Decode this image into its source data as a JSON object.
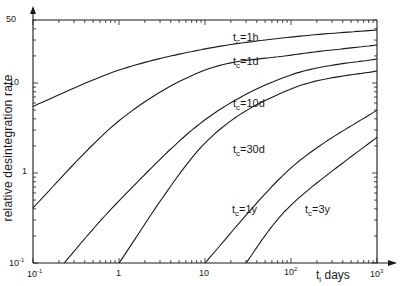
{
  "chart_data": {
    "type": "line",
    "title": "",
    "xlabel": "t_i days",
    "ylabel": "relative desintegration rate",
    "xscale": "log",
    "yscale": "log",
    "xlim": [
      0.1,
      1000
    ],
    "ylim": [
      0.1,
      50
    ],
    "grid": false,
    "legend": "inline curve labels",
    "x_tick_labels": [
      "10^-1",
      "1",
      "10",
      "10^2",
      "10^3"
    ],
    "y_tick_labels": [
      "10^-1",
      "1",
      "10",
      "50"
    ],
    "series": [
      {
        "name": "tc=1h",
        "label_main": "t",
        "label_sub": "c",
        "label_rest": "=1h",
        "x": [
          0.1,
          1,
          10,
          100,
          1000
        ],
        "y": [
          5.5,
          13.9,
          23.9,
          32.4,
          38.8
        ]
      },
      {
        "name": "tc=1d",
        "label_main": "t",
        "label_sub": "c",
        "label_rest": "=1d",
        "x": [
          0.1,
          1,
          10,
          100,
          1000
        ],
        "y": [
          0.41,
          3.8,
          13.9,
          20.4,
          26.4
        ]
      },
      {
        "name": "tc=10d",
        "label_main": "t",
        "label_sub": "c",
        "label_rest": "=10d",
        "x": [
          0.23,
          1,
          10,
          100,
          1000
        ],
        "y": [
          0.1,
          0.49,
          3.9,
          12.3,
          18.5
        ]
      },
      {
        "name": "tc=30d",
        "label_main": "t",
        "label_sub": "c",
        "label_rest": "=30d",
        "x": [
          1,
          10,
          100,
          1000
        ],
        "y": [
          0.1,
          2.15,
          8.6,
          13.6
        ]
      },
      {
        "name": "tc=1y",
        "label_main": "t",
        "label_sub": "c",
        "label_rest": "=1y",
        "x": [
          10,
          100,
          1000
        ],
        "y": [
          0.1,
          1.14,
          5.0
        ]
      },
      {
        "name": "tc=3y",
        "label_main": "t",
        "label_sub": "c",
        "label_rest": "=3y",
        "x": [
          30,
          100,
          1000
        ],
        "y": [
          0.1,
          0.44,
          2.5
        ]
      }
    ]
  },
  "axes": {
    "y_label": "relative desintegration rate",
    "x_label_main": "t",
    "x_label_sub": "i",
    "x_label_rest": " days",
    "y_ticks": {
      "t50": "50",
      "t10": "10",
      "t1": "1",
      "t01_base": "10",
      "t01_exp": "-1"
    },
    "x_ticks": {
      "t01_base": "10",
      "t01_exp": "-1",
      "t1": "1",
      "t10": "10",
      "t100_base": "10",
      "t100_exp": "2",
      "t1000_base": "10",
      "t1000_exp": "3"
    }
  },
  "labels": {
    "l1h": {
      "main": "t",
      "sub": "c",
      "rest": "=1h"
    },
    "l1d": {
      "main": "t",
      "sub": "c",
      "rest": "=1d"
    },
    "l10d": {
      "main": "t",
      "sub": "c",
      "rest": "=10d"
    },
    "l30d": {
      "main": "t",
      "sub": "c",
      "rest": "=30d"
    },
    "l1y": {
      "main": "t",
      "sub": "c",
      "rest": "=1y"
    },
    "l3y": {
      "main": "t",
      "sub": "c",
      "rest": "=3y"
    }
  },
  "colors": {
    "ink": "#1a1a1a",
    "background": "#ffffff"
  }
}
